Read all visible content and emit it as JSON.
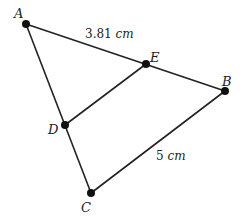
{
  "diagram": {
    "type": "geometry-triangle",
    "points": {
      "A": {
        "label": "A",
        "x": 26,
        "y": 24,
        "lx": 14,
        "ly": 16
      },
      "B": {
        "label": "B",
        "x": 225,
        "y": 91,
        "lx": 222,
        "ly": 82
      },
      "C": {
        "label": "C",
        "x": 91,
        "y": 193,
        "lx": 81,
        "ly": 210
      },
      "D": {
        "label": "D",
        "x": 65,
        "y": 125,
        "lx": 49,
        "ly": 133
      },
      "E": {
        "label": "E",
        "x": 146,
        "y": 64,
        "lx": 150,
        "ly": 62
      }
    },
    "segments": [
      {
        "from": "A",
        "to": "B"
      },
      {
        "from": "A",
        "to": "C"
      },
      {
        "from": "B",
        "to": "C"
      },
      {
        "from": "D",
        "to": "E"
      }
    ],
    "measurements": [
      {
        "value": "3.81",
        "unit": "cm",
        "x": 85,
        "y": 40,
        "segment": "AE"
      },
      {
        "value": "5",
        "unit": "cm",
        "x": 156,
        "y": 160,
        "segment": "BC"
      }
    ],
    "colors": {
      "line": "#222222",
      "point": "#111111",
      "background": "#ffffff"
    }
  }
}
